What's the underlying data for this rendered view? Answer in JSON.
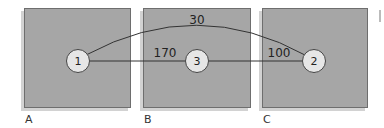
{
  "panels": [
    {
      "label": "A",
      "x": 24,
      "y": 8,
      "w": 106,
      "h": 99
    },
    {
      "label": "B",
      "x": 143,
      "y": 8,
      "w": 107,
      "h": 99
    },
    {
      "label": "C",
      "x": 262,
      "y": 8,
      "w": 105,
      "h": 99
    }
  ],
  "nodes": [
    {
      "id": "1",
      "label": "1",
      "x": 78,
      "y": 61
    },
    {
      "id": "3",
      "label": "3",
      "x": 197,
      "y": 61
    },
    {
      "id": "2",
      "label": "2",
      "x": 314,
      "y": 61
    }
  ],
  "edges": [
    {
      "from": "1",
      "to": "2",
      "weight": "30",
      "curved": true
    },
    {
      "from": "1",
      "to": "3",
      "weight": "170",
      "curved": false
    },
    {
      "from": "3",
      "to": "2",
      "weight": "100",
      "curved": false
    }
  ],
  "labels": {
    "a": "A",
    "b": "B",
    "c": "C",
    "w30": "30",
    "w170": "170",
    "w100": "100",
    "n1": "1",
    "n2": "2",
    "n3": "3"
  }
}
